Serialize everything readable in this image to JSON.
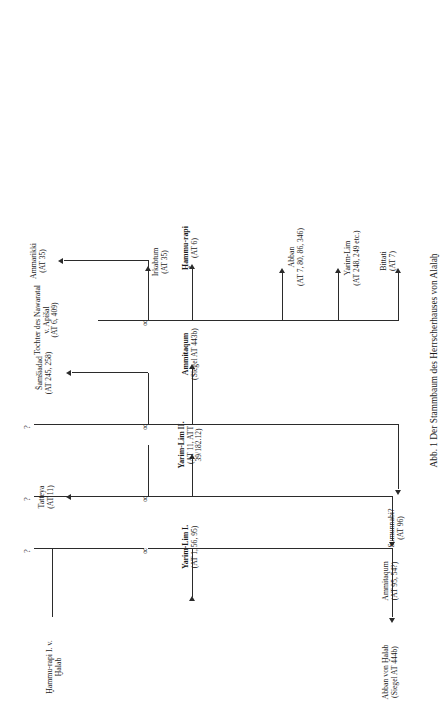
{
  "figure": {
    "caption_number": "Abb. 1",
    "caption_text": "Der Stammbaum des Herrscherhauses von Alalaḫ",
    "caption_full": "Abb. 1  Der Stammbaum des Herrscherhauses von Alalaḫ",
    "type": "genealogical-family-tree",
    "orientation": "rotated-90-ccw",
    "line_color": "#2b2b2b",
    "background_color": "#ffffff",
    "unknown_symbol": "?",
    "marriage_symbol": "∞"
  },
  "nodes": {
    "hammurapi1": {
      "name": "Ḫammu-rapi I. v.",
      "name2": "Ḫalab",
      "ref": "",
      "bold": false
    },
    "unknown_spouse_1": {
      "name": "?",
      "ref": ""
    },
    "abban_von_halab": {
      "name": "Abban von Ḫalab",
      "ref": "(Siegel AT 444b)",
      "bold": false
    },
    "yarimlim1": {
      "name": "Yarim-Lim I.",
      "ref": "(AT 1, 56, 95)",
      "bold": true
    },
    "unknown_spouse_2": {
      "name": "?",
      "ref": ""
    },
    "ammitaqum_a": {
      "name": "Ammitaqum",
      "ref": "(AT 95, 54?)",
      "bold": false
    },
    "tatteya": {
      "name": "Tatteya",
      "ref": "(AT 11)",
      "bold": false
    },
    "yarimlim2": {
      "name": "Yarim-Lim II.",
      "ref": "(AT 11, ATT",
      "ref2": "39/182.12)",
      "bold": true
    },
    "unknown_spouse_3": {
      "name": "?",
      "ref": ""
    },
    "samsiadad": {
      "name": "Šamši⁠adad",
      "ref": "(AT 245, 258)",
      "bold": false
    },
    "sumunnabi": {
      "name": "Sumunnabi?",
      "ref": "(AT 96)",
      "bold": false
    },
    "ammitaqum_b": {
      "name": "Ammitaqum",
      "ref": "(Siegel AT 443b)",
      "bold": true
    },
    "tochter_nawaratal": {
      "name": "Tochter des Nawaratal",
      "name2": "v. Apišal",
      "ref": "(AT 6, 409)",
      "bold": false
    },
    "irkabtum": {
      "name": "Irkabtum",
      "ref": "(AT 35)",
      "bold": false
    },
    "ammarikki": {
      "name": "Ammarikki",
      "ref": "(AT 35)",
      "bold": false
    },
    "hammurapi_son": {
      "name": "Ḫammu-rapi",
      "ref": "(AT 6)",
      "bold": true
    },
    "abban_son": {
      "name": "Abban",
      "ref": "(AT 7, 80, 86, 346)",
      "bold": false
    },
    "yarimlim_son": {
      "name": "Yarim-Lim",
      "ref": "(AT 248, 249 etc.)",
      "bold": false
    },
    "bittati": {
      "name": "Bittati",
      "ref": "(AT 7)",
      "bold": false
    }
  },
  "generations": [
    {
      "label": "gen-1",
      "members": [
        "hammurapi1",
        "unknown_spouse_1"
      ]
    },
    {
      "label": "gen-2",
      "members": [
        "abban_von_halab",
        "yarimlim1",
        "unknown_spouse_2"
      ]
    },
    {
      "label": "gen-3",
      "members": [
        "ammitaqum_a",
        "tatteya",
        "yarimlim2",
        "unknown_spouse_3"
      ]
    },
    {
      "label": "gen-4",
      "members": [
        "samsiadad",
        "sumunnabi",
        "ammitaqum_b",
        "tochter_nawaratal"
      ]
    },
    {
      "label": "gen-5",
      "members": [
        "irkabtum",
        "ammarikki",
        "hammurapi_son",
        "abban_son",
        "yarimlim_son",
        "bittati"
      ]
    }
  ]
}
